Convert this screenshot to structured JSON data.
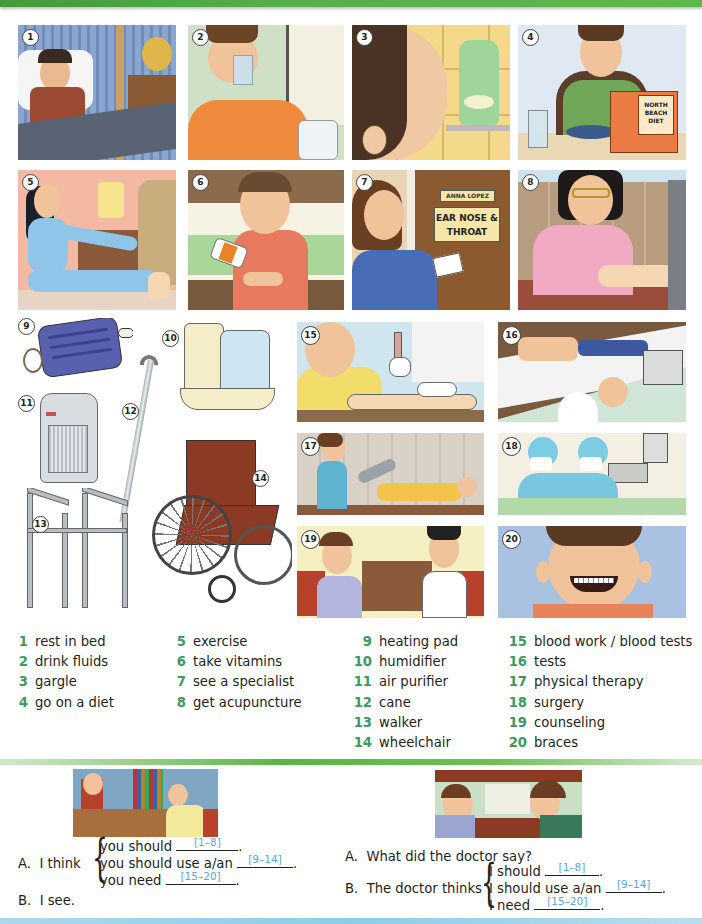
{
  "header": {
    "bar_color": "#52b146"
  },
  "panels": [
    {
      "num": "1",
      "scene": "man resting in bed"
    },
    {
      "num": "2",
      "scene": "man drinking a glass of water"
    },
    {
      "num": "3",
      "scene": "man gargling near mouthwash bottle"
    },
    {
      "num": "4",
      "scene": "man eating and reading diet book",
      "book_title": "NORTH BEACH DIET"
    },
    {
      "num": "5",
      "scene": "woman exercising on floor"
    },
    {
      "num": "6",
      "scene": "man taking vitamins"
    },
    {
      "num": "7",
      "scene": "woman at specialist office door",
      "name_plate": "ANNA LOPEZ",
      "door_sign": "EAR NOSE & THROAT"
    },
    {
      "num": "8",
      "scene": "woman giving acupuncture"
    },
    {
      "num": "9",
      "scene": "heating pad"
    },
    {
      "num": "10",
      "scene": "humidifier"
    },
    {
      "num": "11",
      "scene": "air purifier"
    },
    {
      "num": "12",
      "scene": "cane"
    },
    {
      "num": "13",
      "scene": "walker"
    },
    {
      "num": "14",
      "scene": "wheelchair"
    },
    {
      "num": "15",
      "scene": "blood test being drawn"
    },
    {
      "num": "16",
      "scene": "medical tests"
    },
    {
      "num": "17",
      "scene": "physical therapy"
    },
    {
      "num": "18",
      "scene": "surgery"
    },
    {
      "num": "19",
      "scene": "counseling session"
    },
    {
      "num": "20",
      "scene": "boy with braces"
    }
  ],
  "vocabulary": {
    "col1": [
      {
        "n": "1",
        "label": "rest in bed"
      },
      {
        "n": "2",
        "label": "drink fluids"
      },
      {
        "n": "3",
        "label": "gargle"
      },
      {
        "n": "4",
        "label": "go on a diet"
      }
    ],
    "col2": [
      {
        "n": "5",
        "label": "exercise"
      },
      {
        "n": "6",
        "label": "take vitamins"
      },
      {
        "n": "7",
        "label": "see a specialist"
      },
      {
        "n": "8",
        "label": "get acupuncture"
      }
    ],
    "col3": [
      {
        "n": "9",
        "label": "heating pad"
      },
      {
        "n": "10",
        "label": "humidifier"
      },
      {
        "n": "11",
        "label": "air purifier"
      },
      {
        "n": "12",
        "label": "cane"
      },
      {
        "n": "13",
        "label": "walker"
      },
      {
        "n": "14",
        "label": "wheelchair"
      }
    ],
    "col4": [
      {
        "n": "15",
        "label": "blood work / blood tests"
      },
      {
        "n": "16",
        "label": "tests"
      },
      {
        "n": "17",
        "label": "physical therapy"
      },
      {
        "n": "18",
        "label": "surgery"
      },
      {
        "n": "19",
        "label": "counseling"
      },
      {
        "n": "20",
        "label": "braces"
      }
    ]
  },
  "conversation_left": {
    "a_prefix": "A.",
    "a_text": "I think",
    "lines": [
      {
        "text": "you should",
        "hint": "[1–8]",
        "end": "."
      },
      {
        "text": "you should use a/an",
        "hint": "[9–14]",
        "end": "."
      },
      {
        "text": "you need",
        "hint": "[15–20]",
        "end": "."
      }
    ],
    "b_prefix": "B.",
    "b_text": "I see."
  },
  "conversation_right": {
    "a_prefix": "A.",
    "a_text": "What did the doctor say?",
    "b_prefix": "B.",
    "b_text": "The doctor thinks",
    "lines": [
      {
        "text": "I should",
        "hint": "[1–8]",
        "end": "."
      },
      {
        "text": "I should use a/an",
        "hint": "[9–14]",
        "end": "."
      },
      {
        "text": "I need",
        "hint": "[15–20]",
        "end": "."
      }
    ]
  }
}
